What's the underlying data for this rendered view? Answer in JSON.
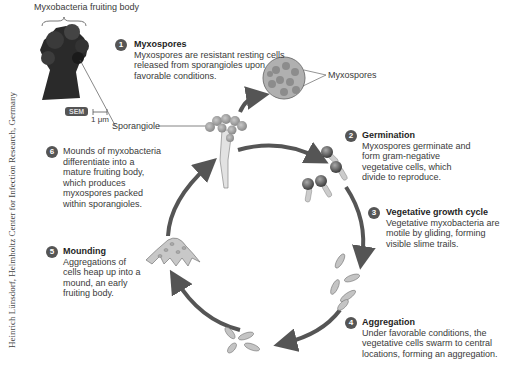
{
  "figure": {
    "header_label": "Myxobacteria fruiting body",
    "sem_badge": "SEM",
    "scale_bar": "1 μm",
    "sporangiole_label": "Sporangiole",
    "myxospores_label": "Myxospores",
    "credit": "Heinrich Lünsdorf, Helmholtz Center for Infection Research, Germany"
  },
  "steps": [
    {
      "number": "1",
      "title": "Myxospores",
      "text": "Myxospores are resistant resting cells released from sporangioles upon favorable conditions."
    },
    {
      "number": "2",
      "title": "Germination",
      "text": "Myxospores germinate and form gram-negative vegetative cells, which divide to reproduce."
    },
    {
      "number": "3",
      "title": "Vegetative growth cycle",
      "text": "Vegetative myxobacteria are motile by gliding, forming visible slime trails."
    },
    {
      "number": "4",
      "title": "Aggregation",
      "text": "Under favorable conditions, the vegetative cells swarm to central locations, forming an aggregation."
    },
    {
      "number": "5",
      "title": "Mounding",
      "text": "Aggregations of cells heap up into a mound, an early fruiting body."
    },
    {
      "number": "6",
      "title": "",
      "text": "Mounds of myxobacteria differentiate into a mature fruiting body, which produces myxospores packed within sporangioles."
    }
  ],
  "colors": {
    "arrow": "#555555",
    "cell": "#b8b8b8",
    "spore": "#6a6a6a",
    "badge": "#555555"
  }
}
